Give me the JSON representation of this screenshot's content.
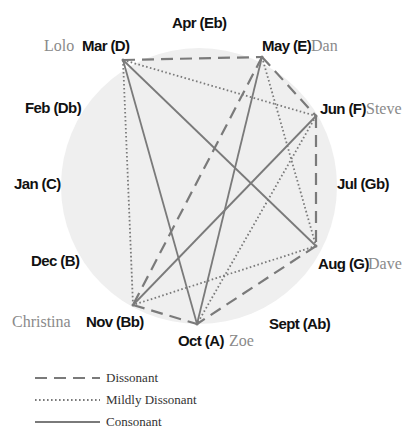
{
  "months": [
    {
      "id": "jan",
      "label": "Jan (C)"
    },
    {
      "id": "feb",
      "label": "Feb (Db)"
    },
    {
      "id": "mar",
      "label": "Mar (D)",
      "person": "Lolo"
    },
    {
      "id": "apr",
      "label": "Apr (Eb)"
    },
    {
      "id": "may",
      "label": "May (E)",
      "person": "Dan"
    },
    {
      "id": "jun",
      "label": "Jun (F)",
      "person": "Steve"
    },
    {
      "id": "jul",
      "label": "Jul (Gb)"
    },
    {
      "id": "aug",
      "label": "Aug (G)",
      "person": "Dave"
    },
    {
      "id": "sep",
      "label": "Sept (Ab)"
    },
    {
      "id": "oct",
      "label": "Oct (A)",
      "person": "Zoe"
    },
    {
      "id": "nov",
      "label": "Nov (Bb)",
      "person": "Christina"
    },
    {
      "id": "dec",
      "label": "Dec (B)"
    }
  ],
  "edges": [
    {
      "from": "mar",
      "to": "may",
      "type": "dissonant"
    },
    {
      "from": "mar",
      "to": "jun",
      "type": "mild"
    },
    {
      "from": "mar",
      "to": "nov",
      "type": "mild"
    },
    {
      "from": "mar",
      "to": "oct",
      "type": "consonant"
    },
    {
      "from": "mar",
      "to": "aug",
      "type": "consonant"
    },
    {
      "from": "may",
      "to": "jun",
      "type": "dissonant"
    },
    {
      "from": "may",
      "to": "nov",
      "type": "dissonant"
    },
    {
      "from": "may",
      "to": "oct",
      "type": "consonant"
    },
    {
      "from": "may",
      "to": "aug",
      "type": "mild"
    },
    {
      "from": "jun",
      "to": "aug",
      "type": "dissonant"
    },
    {
      "from": "jun",
      "to": "nov",
      "type": "consonant"
    },
    {
      "from": "jun",
      "to": "oct",
      "type": "mild"
    },
    {
      "from": "aug",
      "to": "nov",
      "type": "mild"
    },
    {
      "from": "aug",
      "to": "oct",
      "type": "dissonant"
    },
    {
      "from": "nov",
      "to": "oct",
      "type": "dissonant"
    }
  ],
  "legend": [
    {
      "type": "dissonant",
      "label": "Dissonant"
    },
    {
      "type": "mild",
      "label": "Mildly Dissonant"
    },
    {
      "type": "consonant",
      "label": "Consonant"
    }
  ],
  "colors": {
    "circle_fill": "#efefef",
    "edge": "#7a7a7a",
    "month_text": "#111111",
    "person_text": "#8a8a8a"
  }
}
